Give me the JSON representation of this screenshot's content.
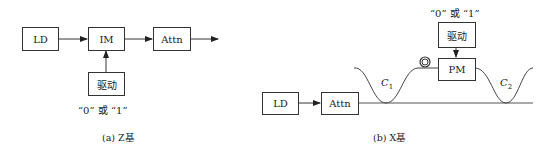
{
  "diagram_a": {
    "boxes": {
      "ld": "LD",
      "im": "IM",
      "attn": "Attn",
      "driver": "驱动"
    },
    "input_label": "“0” 或 “1”",
    "caption": "(a) Z基"
  },
  "diagram_b": {
    "boxes": {
      "ld": "LD",
      "attn": "Attn",
      "pm": "PM",
      "driver": "驱动"
    },
    "input_label": "“0” 或 “1”",
    "couplers": {
      "c1": "C",
      "c1_sub": "1",
      "c2": "C",
      "c2_sub": "2"
    },
    "caption": "(b) X基"
  }
}
